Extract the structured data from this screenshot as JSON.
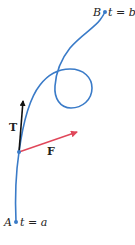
{
  "diagram": {
    "type": "parametric-curve-with-vectors",
    "colors": {
      "curve": "#3a7bc8",
      "tangent_vector": "#111111",
      "force_vector": "#e0475a",
      "point": "#3a7bc8"
    },
    "points": {
      "start": {
        "name": "A",
        "param": "t = a"
      },
      "end": {
        "name": "B",
        "param": "t = b"
      }
    },
    "vectors": {
      "tangent": {
        "label": "T"
      },
      "force": {
        "label": "F"
      }
    }
  }
}
